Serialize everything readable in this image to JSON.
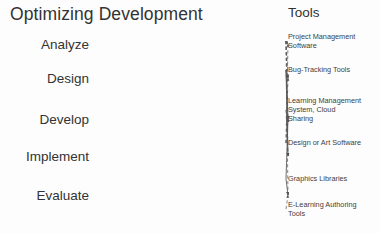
{
  "diagram": {
    "title": "Optimizing Development",
    "right_column_header": "Tools",
    "background_color": "#fdfdfd",
    "line_color": "#555555",
    "text_color": "#333333"
  },
  "phases": [
    {
      "id": "analyze",
      "label": "Analyze",
      "x": 288,
      "y": 44
    },
    {
      "id": "design",
      "label": "Design",
      "x": 288,
      "y": 78
    },
    {
      "id": "develop",
      "label": "Develop",
      "x": 288,
      "y": 119
    },
    {
      "id": "implement",
      "label": "Implement",
      "x": 288,
      "y": 156
    },
    {
      "id": "evaluate",
      "label": "Evaluate",
      "x": 288,
      "y": 195
    }
  ],
  "tools": [
    {
      "id": "project-management-software",
      "lines": [
        "Project Management",
        "Software"
      ],
      "x": 286,
      "y": 41
    },
    {
      "id": "bug-tracking-tools",
      "lines": [
        "Bug-Tracking Tools"
      ],
      "x": 286,
      "y": 70
    },
    {
      "id": "learning-management-system",
      "lines": [
        "Learning Management",
        "System, Cloud",
        "Sharing"
      ],
      "x": 286,
      "y": 110
    },
    {
      "id": "design-or-art-software",
      "lines": [
        "Design or Art Software"
      ],
      "x": 286,
      "y": 143
    },
    {
      "id": "graphics-libraries",
      "lines": [
        "Graphics Libraries"
      ],
      "x": 286,
      "y": 179
    },
    {
      "id": "e-learning-authoring-tools",
      "lines": [
        "E-Learning Authoring",
        "Tools"
      ],
      "x": 286,
      "y": 209
    }
  ],
  "links": [
    {
      "from": "project-management-software",
      "to": "analyze",
      "style": "dotted"
    },
    {
      "from": "project-management-software",
      "to": "design",
      "style": "dashed"
    },
    {
      "from": "project-management-software",
      "to": "develop",
      "style": "dashed"
    },
    {
      "from": "project-management-software",
      "to": "implement",
      "style": "dashed"
    },
    {
      "from": "project-management-software",
      "to": "evaluate",
      "style": "dashed"
    },
    {
      "from": "bug-tracking-tools",
      "to": "design",
      "style": "solid"
    },
    {
      "from": "bug-tracking-tools",
      "to": "develop",
      "style": "solid"
    },
    {
      "from": "bug-tracking-tools",
      "to": "implement",
      "style": "solid"
    },
    {
      "from": "learning-management-system",
      "to": "develop",
      "style": "dashed"
    },
    {
      "from": "learning-management-system",
      "to": "implement",
      "style": "dashed"
    },
    {
      "from": "design-or-art-software",
      "to": "analyze",
      "style": "dashed"
    },
    {
      "from": "design-or-art-software",
      "to": "design",
      "style": "dashed"
    },
    {
      "from": "design-or-art-software",
      "to": "develop",
      "style": "dashed"
    },
    {
      "from": "graphics-libraries",
      "to": "develop",
      "style": "solid"
    },
    {
      "from": "graphics-libraries",
      "to": "evaluate",
      "style": "solid"
    },
    {
      "from": "e-learning-authoring-tools",
      "to": "evaluate",
      "style": "dashed"
    }
  ]
}
